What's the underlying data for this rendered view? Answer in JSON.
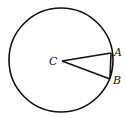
{
  "diagram": {
    "type": "circle-sector",
    "circle": {
      "cx": 61,
      "cy": 60,
      "r": 52
    },
    "points": {
      "C": {
        "label": "C",
        "x": 62,
        "y": 61
      },
      "A": {
        "label": "A",
        "x": 111,
        "y": 53
      },
      "B": {
        "label": "B",
        "x": 110,
        "y": 79
      }
    },
    "segments": [
      "CA",
      "CB",
      "AB"
    ],
    "stroke_color": "#111111"
  }
}
